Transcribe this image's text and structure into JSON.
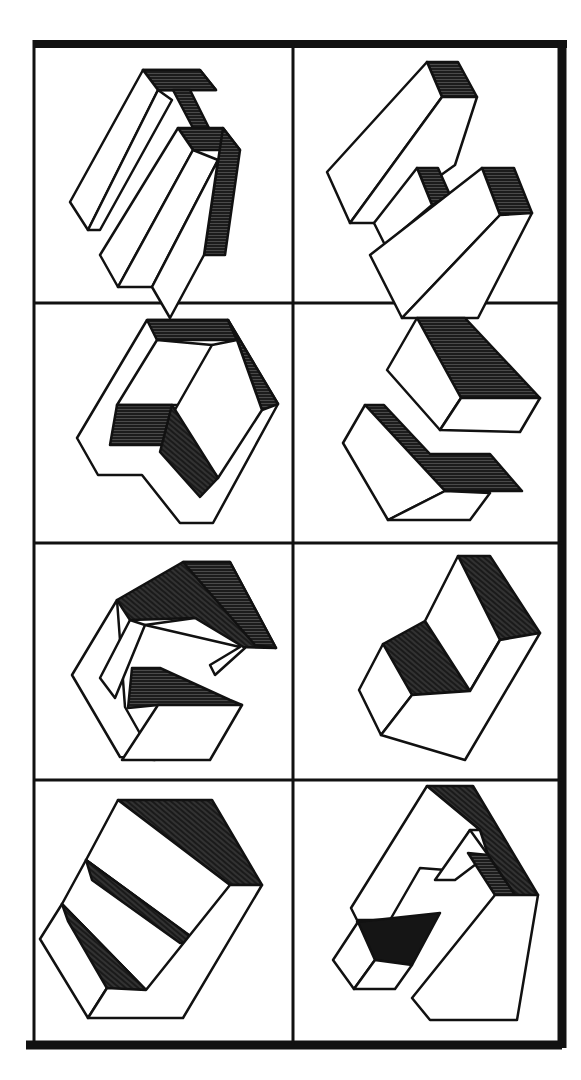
{
  "figure": {
    "title": "",
    "layout": {
      "rows": 4,
      "columns": 2
    },
    "colors": {
      "ink": "#111111",
      "paper": "#ffffff",
      "shade": "#1c1c1c"
    },
    "panels": [
      {
        "id": "r1c1",
        "row": 1,
        "col": 1,
        "description": "Two parallel elongated blocks joined by a shaded bridge"
      },
      {
        "id": "r1c2",
        "row": 1,
        "col": 2,
        "description": "Two stepped oblique blocks with shaded end faces"
      },
      {
        "id": "r2c1",
        "row": 2,
        "col": 1,
        "description": "Hexagonal frame block with shaded inner recess"
      },
      {
        "id": "r2c2",
        "row": 2,
        "col": 2,
        "description": "Two interlocking blocks with shaded top faces"
      },
      {
        "id": "r3c1",
        "row": 3,
        "col": 1,
        "description": "Hook-shaped block with shaded top surfaces"
      },
      {
        "id": "r3c2",
        "row": 3,
        "col": 2,
        "description": "Stepped V-shaped block with two shaded faces"
      },
      {
        "id": "r4c1",
        "row": 4,
        "col": 1,
        "description": "Three-tier staircase block with shaded wedges"
      },
      {
        "id": "r4c2",
        "row": 4,
        "col": 2,
        "description": "Nested frame block with shaded interior channel"
      }
    ]
  }
}
